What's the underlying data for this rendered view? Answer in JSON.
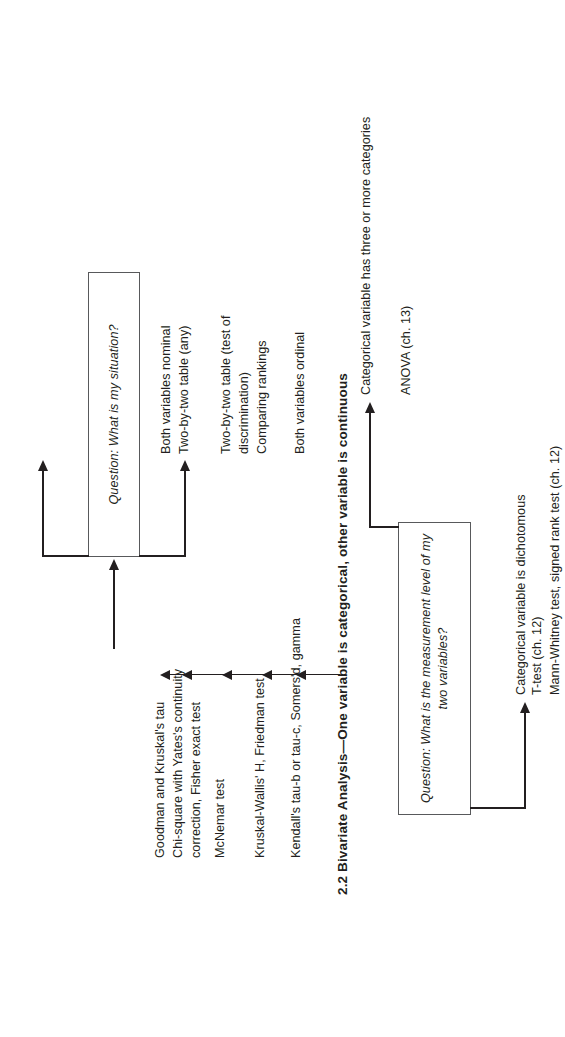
{
  "figure": {
    "section_number": "2.2",
    "section_heading": "Bivariate Analysis—One variable is categorical, other variable is continuous",
    "section_heading_full": "2.2  Bivariate Analysis—One variable is categorical, other variable is continuous"
  },
  "decision_boxes": {
    "situation": {
      "line1": "Question: What is my situation?",
      "text": "Question: What is my situation?"
    },
    "measurement_level": {
      "line1": "Question: What is the measurement level",
      "line2": "of my two variables?",
      "text": "Question: What is the measurement level\nof my two variables?"
    }
  },
  "branches_situation": [
    {
      "condition": "Both variables nominal\nTwo-by-two table (any)",
      "condition_line1": "Both variables nominal",
      "condition_line2": "Two-by-two table (any)",
      "result": "Goodman and Kruskal's tau\nChi-square with Yates's continuity\ncorrection, Fisher exact test",
      "result_line1": "Goodman and Kruskal's tau",
      "result_line2": "Chi-square with Yates's continuity",
      "result_line3": "correction, Fisher exact test"
    },
    {
      "condition": "Two-by-two table (test of\ndiscrimination)\nComparing rankings",
      "condition_line1": "Two-by-two table (test of",
      "condition_line2": "discrimination)",
      "condition_line3": "Comparing rankings",
      "result": "McNemar test\n\nKruskal-Wallis' H, Friedman test",
      "result_line1": "McNemar test",
      "result_line2": "Kruskal-Wallis' H, Friedman test"
    },
    {
      "condition": "Both variables ordinal",
      "condition_line1": "Both variables ordinal",
      "result": "Kendall's tau-b or tau-c, Somers'd, gamma",
      "result_line1": "Kendall's tau-b or tau-c, Somers'd, gamma"
    }
  ],
  "branches_measurement": [
    {
      "condition": "Categorical variable has three or more categories",
      "result": "ANOVA (ch. 13)"
    },
    {
      "condition": "Categorical variable is dichotomous",
      "result_line1": "T-test (ch. 12)",
      "result_line2": "Mann-Whitney test, signed rank test (ch. 12)"
    }
  ],
  "colors": {
    "ink": "#231f20",
    "box_border": "#58595b",
    "background": "#ffffff"
  }
}
